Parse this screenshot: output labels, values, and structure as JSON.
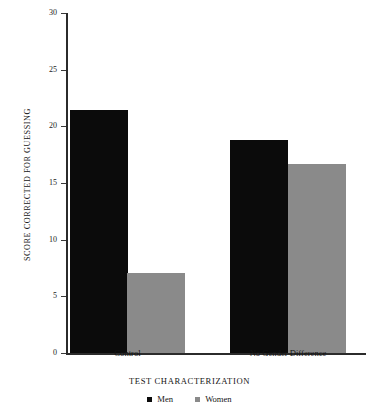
{
  "chart_data": {
    "type": "bar",
    "title": "",
    "xlabel": "TEST CHARACTERIZATION",
    "ylabel": "SCORE CORRECTED FOR GUESSING",
    "categories": [
      "Control",
      "No Gender Difference"
    ],
    "series": [
      {
        "name": "Men",
        "color": "#0b0b0b",
        "values": [
          21.4,
          18.8
        ]
      },
      {
        "name": "Women",
        "color": "#8a8a8a",
        "values": [
          7.1,
          16.7
        ]
      }
    ],
    "ylim": [
      0,
      30
    ],
    "yticks": [
      0,
      5,
      10,
      15,
      20,
      25,
      30
    ],
    "ytick_labels": [
      "0",
      "5",
      "10",
      "15",
      "20",
      "25",
      "30"
    ],
    "grid": false,
    "legend_position": "bottom"
  },
  "legend": {
    "items": [
      {
        "label": "Men",
        "color": "#0b0b0b"
      },
      {
        "label": "Women",
        "color": "#8a8a8a"
      }
    ]
  }
}
